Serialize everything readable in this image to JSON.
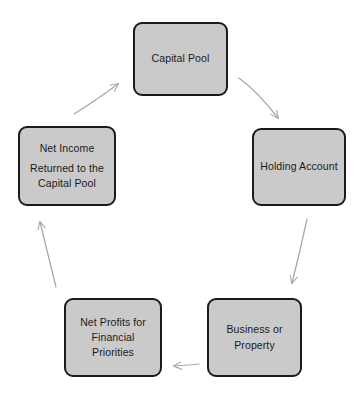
{
  "diagram": {
    "background_color": "#ffffff",
    "node_fill_color": "#cacaca",
    "node_border_color": "#1b1b1b",
    "arrow_color": "#a8a8a8",
    "nodes": [
      {
        "id": "capital-pool",
        "lines": [
          "Capital Pool"
        ]
      },
      {
        "id": "holding-account",
        "lines": [
          "Holding Account"
        ]
      },
      {
        "id": "business-property",
        "lines": [
          "Business or",
          "Property"
        ]
      },
      {
        "id": "net-profits",
        "lines": [
          "Net Profits for",
          "Financial",
          "Priorities"
        ]
      },
      {
        "id": "net-income",
        "lines": [
          "Net Income",
          "Returned to the",
          "Capital Pool"
        ]
      }
    ],
    "arrows": [
      {
        "id": "capital-pool-to-holding-account",
        "from": "capital-pool",
        "to": "holding-account",
        "direction": "down-right"
      },
      {
        "id": "holding-account-to-business-property",
        "from": "holding-account",
        "to": "business-property",
        "direction": "down-left"
      },
      {
        "id": "business-property-to-net-profits",
        "from": "business-property",
        "to": "net-profits",
        "direction": "left"
      },
      {
        "id": "net-profits-to-net-income",
        "from": "net-profits",
        "to": "net-income",
        "direction": "up"
      },
      {
        "id": "net-income-to-capital-pool",
        "from": "net-income",
        "to": "capital-pool",
        "direction": "up-right"
      }
    ]
  }
}
